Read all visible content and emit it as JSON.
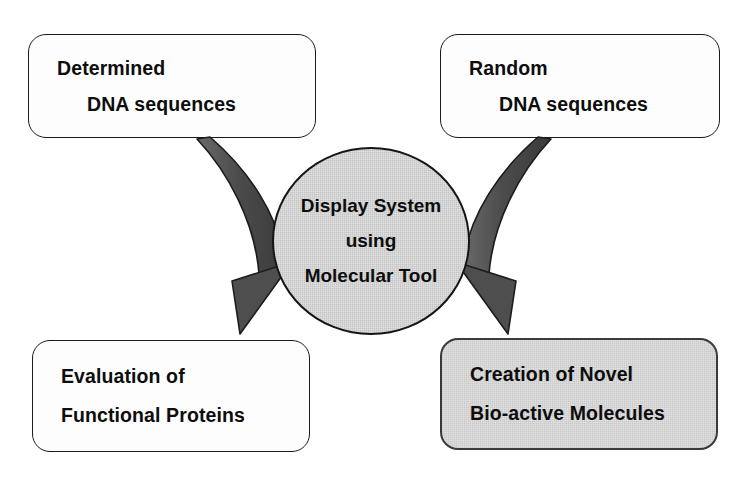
{
  "diagram": {
    "background_color": "#ffffff",
    "arrow_color": "#4a4a4a",
    "arrow_outline_color": "#1a1a1a",
    "gray_fill_color": "#dcdcdc",
    "white_fill_color": "#fdfdfd",
    "text_color": "#0d0d0d"
  },
  "nodes": {
    "top_left": {
      "name": "Determined DNA sequences",
      "line1": "Determined",
      "line2": "DNA sequences",
      "fill": "white"
    },
    "top_right": {
      "name": "Random DNA sequences",
      "line1": "Random",
      "line2": "DNA sequences",
      "fill": "white"
    },
    "center": {
      "name": "Display System using Molecular Tool",
      "line1": "Display System",
      "line2": "using",
      "line3": "Molecular Tool",
      "fill": "gray"
    },
    "bottom_left": {
      "name": "Evaluation of Functional Proteins",
      "line1": "Evaluation of",
      "line2": "Functional Proteins",
      "fill": "white"
    },
    "bottom_right": {
      "name": "Creation of Novel Bio-active Molecules",
      "line1": "Creation of Novel",
      "line2": "Bio-active Molecules",
      "fill": "gray"
    }
  },
  "arrows": [
    {
      "id": "left-arrow",
      "from": "Determined DNA sequences",
      "to": "Evaluation of Functional Proteins",
      "shape": "curved-down-left",
      "icon": "curved-arrow-icon"
    },
    {
      "id": "right-arrow",
      "from": "Random DNA sequences",
      "to": "Creation of Novel Bio-active Molecules",
      "shape": "curved-down-right",
      "icon": "curved-arrow-icon"
    }
  ]
}
